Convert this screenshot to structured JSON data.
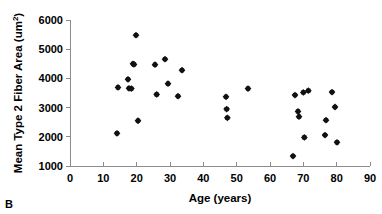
{
  "figure": {
    "panel_label": "B"
  },
  "chart_data": {
    "type": "scatter",
    "title": "",
    "xlabel": "Age (years)",
    "ylabel_main": "Mean Type 2 Fiber Area (um",
    "ylabel_sup": "2",
    "ylabel_close": ")",
    "ylabel": "Mean Type 2 Fiber Area (um2)",
    "xlim": [
      0,
      90
    ],
    "ylim": [
      1000,
      6000
    ],
    "xticks": [
      0,
      10,
      20,
      30,
      40,
      50,
      60,
      70,
      80,
      90
    ],
    "yticks": [
      1000,
      2000,
      3000,
      4000,
      5000,
      6000
    ],
    "xtick_labels": [
      "0",
      "10",
      "20",
      "30",
      "40",
      "50",
      "60",
      "70",
      "80",
      "90"
    ],
    "ytick_labels": [
      "1000",
      "2000",
      "3000",
      "4000",
      "5000",
      "6000"
    ],
    "grid": false,
    "legend": false,
    "marker": "filled-diamond",
    "marker_color": "#111111",
    "series": [
      {
        "name": "Mean Type 2 Fiber Area",
        "points": [
          {
            "x": 14.1,
            "y": 2120
          },
          {
            "x": 14.4,
            "y": 3690
          },
          {
            "x": 17.4,
            "y": 3970
          },
          {
            "x": 17.7,
            "y": 3660
          },
          {
            "x": 18.4,
            "y": 3650
          },
          {
            "x": 18.9,
            "y": 4500
          },
          {
            "x": 19.2,
            "y": 4480
          },
          {
            "x": 19.8,
            "y": 5480
          },
          {
            "x": 20.4,
            "y": 2550
          },
          {
            "x": 25.5,
            "y": 4470
          },
          {
            "x": 26.0,
            "y": 3450
          },
          {
            "x": 28.5,
            "y": 4660
          },
          {
            "x": 29.4,
            "y": 3820
          },
          {
            "x": 32.4,
            "y": 3390
          },
          {
            "x": 33.6,
            "y": 4280
          },
          {
            "x": 46.8,
            "y": 3370
          },
          {
            "x": 47.0,
            "y": 2950
          },
          {
            "x": 47.2,
            "y": 2650
          },
          {
            "x": 53.4,
            "y": 3650
          },
          {
            "x": 66.9,
            "y": 1340
          },
          {
            "x": 67.5,
            "y": 3430
          },
          {
            "x": 68.4,
            "y": 2870
          },
          {
            "x": 68.7,
            "y": 2690
          },
          {
            "x": 70.0,
            "y": 3520
          },
          {
            "x": 70.3,
            "y": 1980
          },
          {
            "x": 71.5,
            "y": 3580
          },
          {
            "x": 76.5,
            "y": 2060
          },
          {
            "x": 76.8,
            "y": 2570
          },
          {
            "x": 78.6,
            "y": 3530
          },
          {
            "x": 79.5,
            "y": 3020
          },
          {
            "x": 80.1,
            "y": 1810
          }
        ]
      }
    ]
  }
}
